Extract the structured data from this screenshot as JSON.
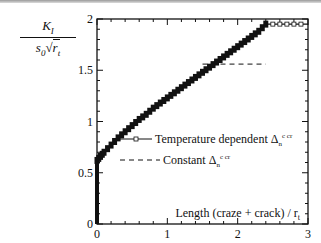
{
  "chart_data": {
    "type": "line",
    "title": "",
    "ylabel": "K_I / (s_0 sqrt(r_t))",
    "xlabel": "Length (craze + crack) / r_t",
    "xlim": [
      0,
      3
    ],
    "ylim": [
      0,
      2
    ],
    "xticks": [
      "0",
      "1",
      "2",
      "3"
    ],
    "yticks": [
      "0",
      "0.5",
      "1",
      "1.5",
      "2"
    ],
    "grid": false,
    "legend_position": "center-right",
    "series": [
      {
        "name": "Temperature dependent Δn c cr",
        "style": "solid line with square markers",
        "x": [
          0,
          0,
          0.05,
          0.1,
          0.2,
          0.3,
          0.4,
          0.5,
          0.6,
          0.7,
          0.8,
          0.9,
          1.0,
          1.1,
          1.2,
          1.3,
          1.4,
          1.5,
          1.6,
          1.7,
          1.8,
          1.9,
          2.0,
          2.1,
          2.2,
          2.3,
          2.4,
          2.5,
          2.6,
          2.7,
          2.8,
          2.9,
          3.0
        ],
        "y": [
          0,
          0.62,
          0.66,
          0.7,
          0.77,
          0.84,
          0.9,
          0.96,
          1.02,
          1.07,
          1.13,
          1.18,
          1.23,
          1.28,
          1.33,
          1.38,
          1.43,
          1.48,
          1.53,
          1.58,
          1.63,
          1.68,
          1.73,
          1.78,
          1.83,
          1.88,
          1.95,
          1.95,
          1.95,
          1.95,
          1.95,
          1.95,
          1.95
        ]
      },
      {
        "name": "Constant Δn c cr",
        "style": "dashed line",
        "x": [
          1.5,
          2.4
        ],
        "y": [
          1.56,
          1.56
        ]
      }
    ]
  },
  "labels": {
    "y_num": "K",
    "y_num_sub": "I",
    "y_den": "s",
    "y_den_sub": "0",
    "y_den_root": "r",
    "y_den_root_sub": "t",
    "x_axis": "Length (craze + crack) / r",
    "x_axis_sub": "t",
    "legend_1": "Temperature dependent Δ",
    "legend_2": "Constant Δ",
    "legend_sub": "n",
    "legend_sup": "c cr"
  }
}
